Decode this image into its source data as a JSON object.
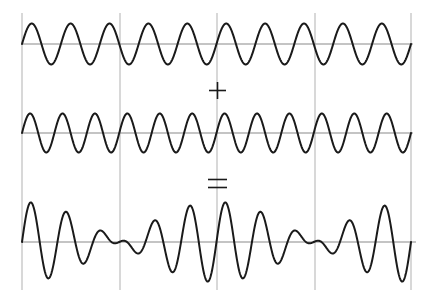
{
  "figure": {
    "operators": {
      "plus": "+",
      "equals": "="
    },
    "colors": {
      "wave": "#1a1a1a",
      "baseline": "#8a8a8a",
      "gridline": "#c8c8c8",
      "background": "#ffffff"
    },
    "plot_area": {
      "x_start": 22,
      "x_end": 411,
      "grid_top": 13,
      "grid_bottom": 290
    },
    "vertical_gridlines_x": [
      22,
      120,
      217,
      315,
      411
    ],
    "panels": [
      {
        "name": "wave-1",
        "label": "sin wave, 10 cycles",
        "baseline_y": 44,
        "cycles": 10,
        "amplitude_px": 20.5,
        "components": [
          {
            "cycles": 10,
            "amplitude_px": 20.5
          }
        ]
      },
      {
        "name": "wave-2",
        "label": "sin wave, 12 cycles",
        "baseline_y": 133,
        "cycles": 12,
        "amplitude_px": 19.5,
        "components": [
          {
            "cycles": 12,
            "amplitude_px": 19.5
          }
        ]
      },
      {
        "name": "sum-wave",
        "label": "sum (beat pattern)",
        "baseline_y": 242,
        "components": [
          {
            "cycles": 10,
            "amplitude_px": 20.5
          },
          {
            "cycles": 12,
            "amplitude_px": 19.5
          }
        ]
      }
    ]
  }
}
